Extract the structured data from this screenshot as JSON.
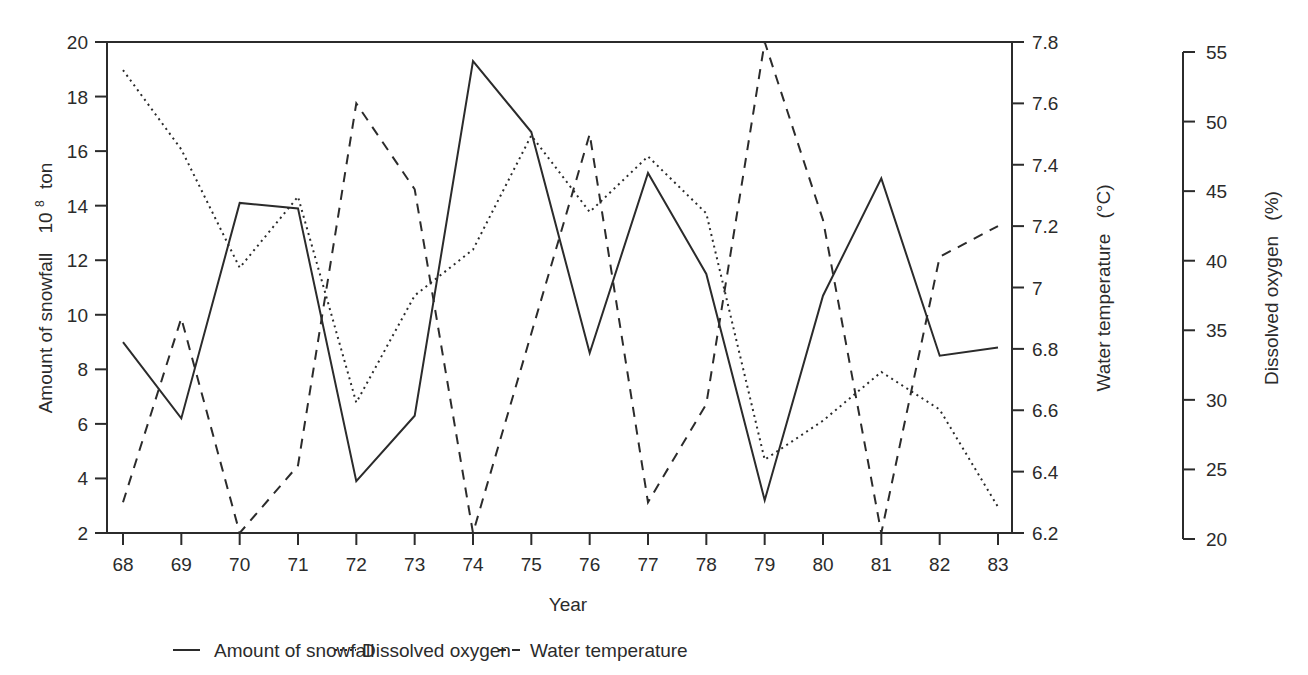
{
  "chart_data": {
    "type": "line",
    "title": "",
    "xlabel": "Year",
    "x": [
      "68",
      "69",
      "70",
      "71",
      "72",
      "73",
      "74",
      "75",
      "76",
      "77",
      "78",
      "79",
      "80",
      "81",
      "82",
      "83"
    ],
    "axes": {
      "left": {
        "label": "Amount of snowfall",
        "unit_base": "10",
        "unit_exp": "8",
        "unit_word": "ton",
        "ylim": [
          2,
          20
        ],
        "ticks": [
          2,
          4,
          6,
          8,
          10,
          12,
          14,
          16,
          18,
          20
        ]
      },
      "right_inner": {
        "label": "Water temperature",
        "unit": "(°C)",
        "ylim": [
          6.2,
          7.8
        ],
        "ticks": [
          "6.2",
          "6.4",
          "6.6",
          "6.8",
          "7",
          "7.2",
          "7.4",
          "7.6",
          "7.8"
        ]
      },
      "right_outer": {
        "label": "Dissolved oxygen",
        "unit": "(%)",
        "ylim": [
          20,
          55
        ],
        "ticks": [
          20,
          25,
          30,
          35,
          40,
          45,
          50,
          55
        ]
      }
    },
    "series": [
      {
        "name": "Amount of snowfall",
        "axis": "left",
        "style": "solid",
        "values": [
          9.0,
          6.2,
          14.1,
          13.9,
          3.9,
          6.3,
          19.3,
          16.7,
          8.6,
          15.2,
          11.5,
          3.2,
          10.7,
          15.0,
          8.5,
          8.8
        ]
      },
      {
        "name": "Dissolved oxygen",
        "axis": "right_outer",
        "style": "dotted",
        "values": [
          53.7,
          48.0,
          39.5,
          44.6,
          29.8,
          37.5,
          40.8,
          49.0,
          43.5,
          47.5,
          43.4,
          25.7,
          28.5,
          32.0,
          29.3,
          22.3
        ]
      },
      {
        "name": "Water temperature",
        "axis": "right_inner",
        "style": "dashed",
        "values": [
          6.3,
          6.9,
          6.2,
          6.42,
          7.6,
          7.32,
          6.2,
          6.85,
          7.5,
          6.3,
          6.62,
          7.8,
          7.22,
          6.2,
          7.1,
          7.2
        ]
      }
    ],
    "legend": {
      "position": "bottom",
      "items": [
        "Amount of snowfall",
        "Dissolved oxygen",
        "Water  temperature"
      ]
    },
    "grid": false
  }
}
